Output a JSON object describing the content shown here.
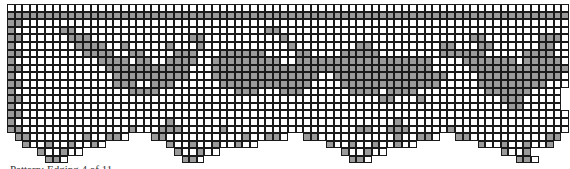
{
  "chart_title": "Filet crochet edging chart with animal motifs",
  "caption": "Pattern: Edging 4 of 11",
  "colors": {
    "filled": "#9a9a9a",
    "open": "#ffffff",
    "grid": "#1a1a1a"
  },
  "legend": {
    "X": "filled block",
    ".": "open mesh",
    " ": "no stitch"
  },
  "grid": {
    "columns": 74,
    "rows": [
      "..........................................................................",
      "XXXXXXXXXXXXXXXXXXXXXXXXXXXXXXXXXXXXXXXXXXXXXXXXXXXXXXXXXXXXXXXXXXXXXXXXXX",
      "XX........................................................................",
      "X......XX.........................XX......................................",
      "XX......XXX.............XX..........X........................XX.......XXX.",
      "X........XXXX..X.....X...X...........X........XX.........XX...XX......XX..",
      "XX........XXXX..XX....XXX...XXXXXX....XX....XXXXX........XXXXXX.....XXXX..",
      "X...........XXXX.XX..XXXX..XXXXXXXXX..XXXXXXXXXXXXXXXXXX....XXXXXXX.XXXXX.",
      "XX...........XXXXXXXXXXX...XXXXXXXXXXXXXXXXXXXXXXXXXXXXX.....XXXXXXXXXXXXX",
      "X.............XXXXXXXXXX...XXXXXXXXXXXXXX..XXXXXXXXXXXXXXX....XXXXXXXXXXX.",
      "XX............XXX..XXX......XXXXXXXXXXXX....XXXXXXXXXXXXX.....XXXXXXXXX...",
      "X...............XXXX..........XXX...XXX......XXXX.XXXX.........XXXXXX....",
      "XX...............................................XX...X..........XXX.....",
      "X.................................................................XX.....",
      "XX........................................................................",
      "X....................X.............................X.......................",
      "XX..............X...XXX.....X.................XX..XXX.....X.................",
      " XX.......X..XX.   XX..........X..XX.  XX..........X..XX.  XX..........XX",
      "  X..X..X..X.        X..X..X..X..         X..X..X..X..        X..X..X..X",
      "    X..X..            X..X..                X..X..               X..X",
      "     XX.               XX.                   XX.                   XX."
    ]
  }
}
